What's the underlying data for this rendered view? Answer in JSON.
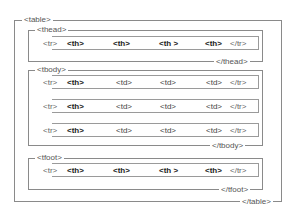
{
  "diagram": {
    "table": {
      "open": "<table>",
      "close": "</table>"
    },
    "thead": {
      "open": "<thead>",
      "close": "</thead>",
      "rows": [
        {
          "open": "<tr>",
          "cells": [
            "<th>",
            "<th>",
            "<th >",
            "<th>"
          ],
          "close": "</tr>"
        }
      ]
    },
    "tbody": {
      "open": "<tbody>",
      "close": "</tbody>",
      "rows": [
        {
          "open": "<tr>",
          "cells": [
            "<th>",
            "<td>",
            "<td>",
            "<td>"
          ],
          "close": "</tr>"
        },
        {
          "open": "<tr>",
          "cells": [
            "<th>",
            "<td>",
            "<td>",
            "<td>"
          ],
          "close": "</tr>"
        },
        {
          "open": "<tr>",
          "cells": [
            "<th>",
            "<td>",
            "<td>",
            "<td>"
          ],
          "close": "</tr>"
        }
      ]
    },
    "tfoot": {
      "open": "<tfoot>",
      "close": "</tfoot>",
      "rows": [
        {
          "open": "<tr>",
          "cells": [
            "<th>",
            "<th>",
            "<th >",
            "<th>"
          ],
          "close": "</tr>"
        }
      ]
    }
  }
}
